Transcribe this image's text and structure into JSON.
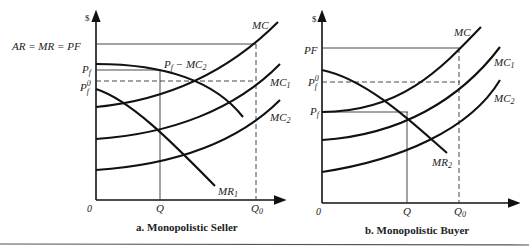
{
  "panel_a": {
    "caption": "a.  Monopolistic Seller",
    "y_axis_label": "$",
    "origin": "0",
    "x_ticks": {
      "Q": "Q",
      "Q0": "Q",
      "Q0_sub": "0"
    },
    "y_ticks": {
      "top_line": "AR = MR = PF",
      "Pf": "P",
      "Pf_sub": "f",
      "Pf0": "P",
      "Pf0_sup": "0",
      "Pf0_sub": "f"
    },
    "curves": {
      "MC": "MC",
      "MC1": "MC",
      "MC1_sub": "1",
      "MC2": "MC",
      "MC2_sub": "2",
      "MR1": "MR",
      "MR1_sub": "1",
      "Pf_minus_MC2": "P",
      "Pf_minus_MC2_sub": "f",
      "Pf_minus_MC2_rest": " − MC",
      "Pf_minus_MC2_rest_sub": "2"
    }
  },
  "panel_b": {
    "caption": "b.  Monopolistic Buyer",
    "y_axis_label": "$",
    "origin": "0",
    "x_ticks": {
      "Q": "Q",
      "Q0": "Q",
      "Q0_sub": "0"
    },
    "y_ticks": {
      "PF": "PF",
      "Pf0": "P",
      "Pf0_sup": "0",
      "Pf0_sub": "f",
      "Pf": "P",
      "Pf_sub": "f"
    },
    "curves": {
      "MC": "MC",
      "MC1": "MC",
      "MC1_sub": "1",
      "MC2": "MC",
      "MC2_sub": "2",
      "MR2": "MR",
      "MR2_sub": "2"
    }
  }
}
